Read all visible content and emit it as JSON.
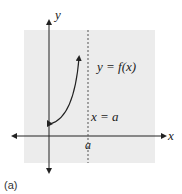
{
  "figure": {
    "caption": "(a)",
    "background_color": "#ececec",
    "axis_color": "#222222",
    "labels": {
      "y_axis": "y",
      "x_axis": "x",
      "function": "y = f(x)",
      "asymptote": "x = a",
      "a_tick": "a"
    },
    "elements": {
      "curve": "increasing curve starting at closed point on y-axis with arrow heading up toward asymptote",
      "asymptote_style": "dashed vertical line"
    }
  }
}
